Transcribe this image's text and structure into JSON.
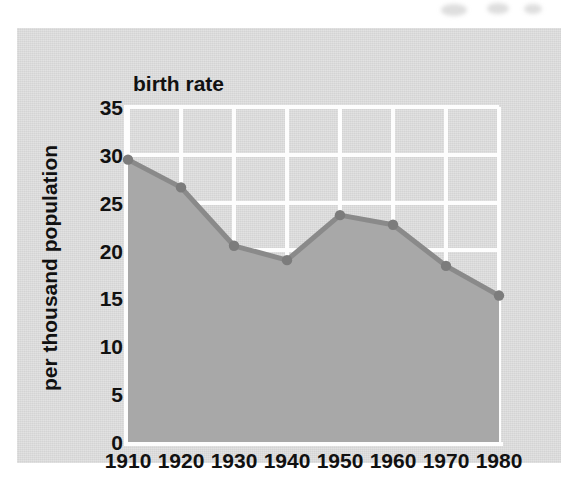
{
  "chart_data": {
    "type": "area",
    "title": "birth rate",
    "xlabel": "",
    "ylabel": "per thousand population",
    "categories": [
      "1910",
      "1920",
      "1930",
      "1940",
      "1950",
      "1960",
      "1970",
      "1980"
    ],
    "x": [
      1910,
      1920,
      1930,
      1940,
      1950,
      1960,
      1970,
      1980
    ],
    "values": [
      29.5,
      26.6,
      20.5,
      19.0,
      23.7,
      22.7,
      18.4,
      15.3
    ],
    "series": [
      {
        "name": "birth rate",
        "values": [
          29.5,
          26.6,
          20.5,
          19.0,
          23.7,
          22.7,
          18.4,
          15.3
        ]
      }
    ],
    "ylim": [
      0,
      35
    ],
    "xlim": [
      1910,
      1980
    ],
    "ytick_labels": [
      "0",
      "5",
      "10",
      "15",
      "20",
      "25",
      "30",
      "35"
    ],
    "ytick_values": [
      0,
      5,
      10,
      15,
      20,
      25,
      30,
      35
    ],
    "xtick_labels": [
      "1910",
      "1920",
      "1930",
      "1940",
      "1950",
      "1960",
      "1970",
      "1980"
    ],
    "grid": true,
    "legend": "none",
    "colors": {
      "panel_background": "#d9d9d9",
      "plot_background": "#d3d3d3",
      "area_fill": "#a8a8a8",
      "line": "#8a8a8a",
      "marker": "#7c7c7c",
      "gridline": "#fdfdfd",
      "text": "#111111"
    }
  }
}
